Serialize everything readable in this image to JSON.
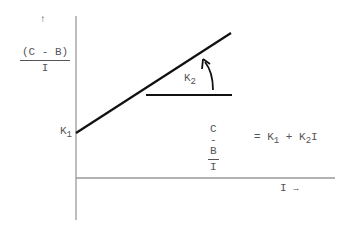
{
  "diagram": {
    "y_axis": {
      "arrow": "↑",
      "label_numerator": "(C - B)",
      "label_denominator": "I"
    },
    "x_axis": {
      "label": "I",
      "arrow": "→"
    },
    "intercept_label": {
      "base": "K",
      "sub": "1"
    },
    "slope_label": {
      "base": "K",
      "sub": "2"
    },
    "equation": {
      "lhs_numerator": "C - B",
      "lhs_denominator": "I",
      "equals": "=",
      "term1_base": "K",
      "term1_sub": "1",
      "plus": "+",
      "term2_base": "K",
      "term2_sub": "2",
      "term2_var": "I"
    },
    "colors": {
      "line": "#111111",
      "axis": "#888888",
      "text": "#555555"
    }
  }
}
